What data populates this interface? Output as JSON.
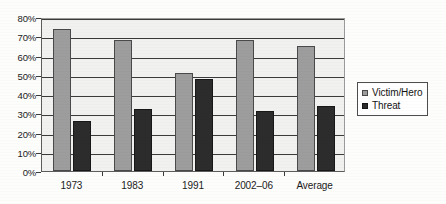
{
  "chart_data": {
    "type": "bar",
    "title": "",
    "subtitle": "",
    "xlabel": "",
    "ylabel": "",
    "categories": [
      "1973",
      "1983",
      "1991",
      "2002–06",
      "Average"
    ],
    "series": [
      {
        "name": "Victim/Hero",
        "color": "#9d9d9d",
        "values": [
          74,
          68,
          51,
          68,
          65
        ]
      },
      {
        "name": "Threat",
        "color": "#2c2c2c",
        "values": [
          26,
          32,
          48,
          31,
          34
        ]
      }
    ],
    "ylim": [
      0,
      80
    ],
    "ytick_values": [
      0,
      10,
      20,
      30,
      40,
      50,
      60,
      70,
      80
    ],
    "ytick_labels": [
      "0%",
      "10%",
      "20%",
      "30%",
      "40%",
      "50%",
      "60%",
      "70%",
      "80%"
    ],
    "grid": true,
    "grid_axis": "y",
    "legend_position": "right",
    "value_suffix": "%"
  },
  "legend": {
    "items": [
      {
        "label": "Victim/Hero"
      },
      {
        "label": "Threat"
      }
    ]
  },
  "axes": {
    "y_title": "",
    "x_title": ""
  }
}
